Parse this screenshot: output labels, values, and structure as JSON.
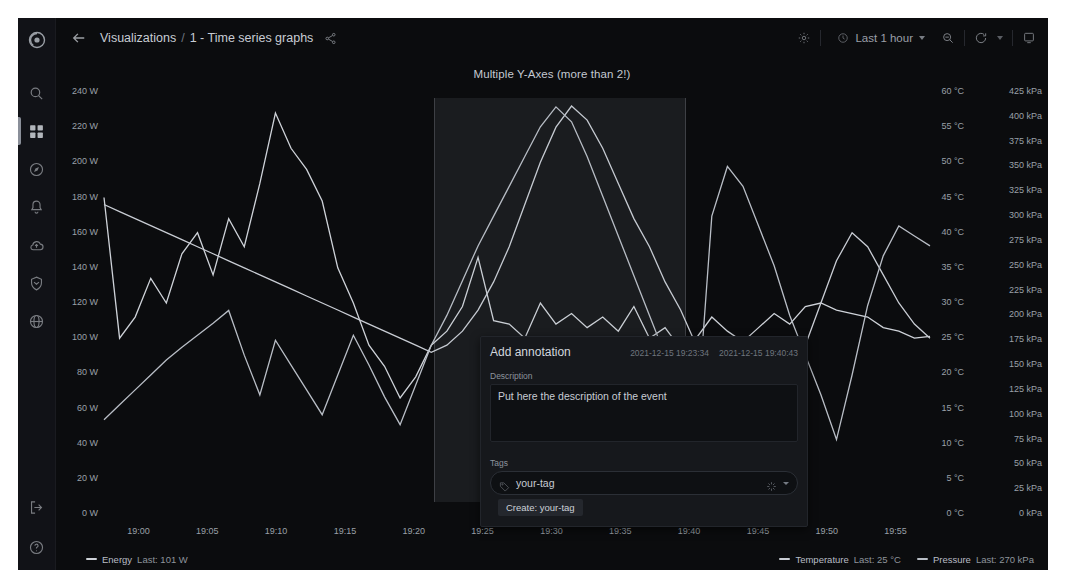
{
  "app": {
    "name": "Grafana",
    "logo_icon": "grafana-logo-icon"
  },
  "sidebar": {
    "items": [
      {
        "name": "search",
        "icon": "search-icon",
        "active": false
      },
      {
        "name": "dashboards",
        "icon": "dashboards-grid-icon",
        "active": true
      },
      {
        "name": "explore",
        "icon": "compass-icon",
        "active": false
      },
      {
        "name": "alerting",
        "icon": "bell-icon",
        "active": false
      },
      {
        "name": "cloud",
        "icon": "cloud-icon",
        "active": false
      },
      {
        "name": "shield",
        "icon": "shield-icon",
        "active": false
      },
      {
        "name": "server-admin",
        "icon": "globe-icon",
        "active": false
      }
    ],
    "bottom": [
      {
        "name": "sign-out",
        "icon": "sign-out-icon"
      },
      {
        "name": "help",
        "icon": "help-circle-icon"
      }
    ]
  },
  "topnav": {
    "back_icon": "arrow-left-icon",
    "breadcrumb": {
      "root": "Visualizations",
      "separator": "/",
      "current": "1 - Time series graphs"
    },
    "share_icon": "share-icon",
    "settings_icon": "gear-icon",
    "timepicker": {
      "icon": "clock-icon",
      "label": "Last 1 hour",
      "caret": "chevron-down-icon"
    },
    "zoom_out_icon": "zoom-out-icon",
    "refresh_icon": "refresh-icon",
    "refresh_caret": "chevron-down-icon",
    "panel_icon": "tv-panel-icon"
  },
  "panel": {
    "title": "Multiple Y-Axes (more than 2!)"
  },
  "chart_data": {
    "type": "line",
    "title": "Multiple Y-Axes (more than 2!)",
    "xlabel": "",
    "grid": false,
    "legend_position": "bottom",
    "x_tick_labels": [
      "19:00",
      "19:05",
      "19:10",
      "19:15",
      "19:20",
      "19:25",
      "19:30",
      "19:35",
      "19:40",
      "19:45",
      "19:50",
      "19:55"
    ],
    "axes": [
      {
        "name": "Energy",
        "side": "left",
        "unit": "W",
        "min": 0,
        "max": 240,
        "step": 20,
        "ticks": [
          "0 W",
          "20 W",
          "40 W",
          "60 W",
          "80 W",
          "100 W",
          "120 W",
          "140 W",
          "160 W",
          "180 W",
          "200 W",
          "220 W",
          "240 W"
        ]
      },
      {
        "name": "Temperature",
        "side": "right",
        "unit": "°C",
        "min": 0,
        "max": 60,
        "step": 5,
        "ticks": [
          "0 °C",
          "5 °C",
          "10 °C",
          "15 °C",
          "20 °C",
          "25 °C",
          "30 °C",
          "35 °C",
          "40 °C",
          "45 °C",
          "50 °C",
          "55 °C",
          "60 °C"
        ]
      },
      {
        "name": "Pressure",
        "side": "right",
        "unit": "kPa",
        "min": 0,
        "max": 425,
        "step": 25,
        "ticks": [
          "0 kPa",
          "25 kPa",
          "50 kPa",
          "75 kPa",
          "100 kPa",
          "125 kPa",
          "150 kPa",
          "175 kPa",
          "200 kPa",
          "225 kPa",
          "250 kPa",
          "275 kPa",
          "300 kPa",
          "325 kPa",
          "350 kPa",
          "375 kPa",
          "400 kPa",
          "425 kPa"
        ]
      }
    ],
    "series": [
      {
        "name": "Energy",
        "axis": "left",
        "unit": "W",
        "color": "#cfd3d9",
        "last_value": "101 W",
        "values": [
          180,
          100,
          112,
          134,
          120,
          148,
          160,
          136,
          168,
          152,
          188,
          228,
          208,
          196,
          178,
          140,
          120,
          96,
          84,
          66,
          78,
          96,
          104,
          118,
          146,
          110,
          108,
          100,
          120,
          108,
          114,
          106,
          112,
          104,
          118,
          100,
          106,
          94,
          100,
          112,
          104,
          98,
          106,
          114,
          108,
          118,
          120,
          116,
          114,
          112,
          106,
          104,
          100,
          101
        ]
      },
      {
        "name": "Temperature",
        "axis": "right-0",
        "unit": "°C",
        "color": "#c9cdd4",
        "last_value": "25 °C",
        "values": [
          44,
          43,
          42,
          41,
          40,
          39,
          38,
          37,
          36,
          35,
          34,
          33,
          32,
          31,
          30,
          29,
          28,
          27,
          26,
          25,
          24,
          23,
          24,
          26,
          29,
          33,
          38,
          44,
          50,
          55,
          58,
          56,
          52,
          47,
          42,
          38,
          33,
          29,
          24,
          20,
          15,
          11,
          8,
          12,
          18,
          24,
          30,
          36,
          40,
          38,
          34,
          30,
          27,
          25
        ]
      },
      {
        "name": "Pressure",
        "axis": "right-1",
        "unit": "kPa",
        "color": "#b9bec6",
        "last_value": "270 kPa",
        "values": [
          95,
          110,
          125,
          140,
          155,
          168,
          180,
          192,
          205,
          160,
          120,
          175,
          150,
          125,
          100,
          140,
          180,
          150,
          118,
          90,
          130,
          170,
          200,
          235,
          270,
          300,
          330,
          360,
          390,
          410,
          395,
          360,
          320,
          280,
          240,
          200,
          160,
          120,
          85,
          300,
          350,
          330,
          290,
          250,
          200,
          160,
          120,
          75,
          140,
          210,
          260,
          290,
          280,
          270
        ]
      }
    ]
  },
  "selection": {
    "start": "19:23:34",
    "end": "19:40:43"
  },
  "legend": {
    "items": [
      {
        "name": "Energy",
        "label": "Energy",
        "stat_label": "Last:",
        "value": "101 W",
        "color": "#cfd3d9",
        "side": "left"
      },
      {
        "name": "Temperature",
        "label": "Temperature",
        "stat_label": "Last:",
        "value": "25 °C",
        "color": "#c9cdd4",
        "side": "right"
      },
      {
        "name": "Pressure",
        "label": "Pressure",
        "stat_label": "Last:",
        "value": "270 kPa",
        "color": "#b9bec6",
        "side": "right"
      }
    ]
  },
  "annotation_dialog": {
    "title": "Add annotation",
    "time_from": "2021-12-15 19:23:34",
    "time_to": "2021-12-15 19:40:43",
    "description_label": "Description",
    "description_value": "Put here the description of the event",
    "description_placeholder": "Description",
    "tags_label": "Tags",
    "tags_value": "your-tag",
    "tags_placeholder": "Add tags",
    "tag_icon": "tag-icon",
    "spinner_icon": "loading-spinner-icon",
    "caret_icon": "chevron-down-icon",
    "create_option": "Create: your-tag"
  }
}
